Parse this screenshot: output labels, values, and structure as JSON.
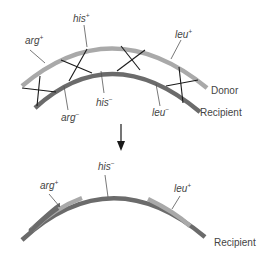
{
  "colors": {
    "donor": "#a9a9a9",
    "recipient": "#6b6b6b",
    "crossover": "#1a1a1a",
    "leader": "#555555",
    "text": "#444444"
  },
  "top": {
    "donor_label": "Donor",
    "recipient_label": "Recipient",
    "genes_donor": [
      {
        "name": "arg",
        "sup": "+"
      },
      {
        "name": "his",
        "sup": "+"
      },
      {
        "name": "leu",
        "sup": "+"
      }
    ],
    "genes_recipient": [
      {
        "name": "arg",
        "sup": "−"
      },
      {
        "name": "his",
        "sup": "−"
      },
      {
        "name": "leu",
        "sup": "−"
      }
    ]
  },
  "bottom": {
    "recipient_label": "Recipient",
    "genes": [
      {
        "name": "arg",
        "sup": "+"
      },
      {
        "name": "his",
        "sup": "−"
      },
      {
        "name": "leu",
        "sup": "+"
      }
    ]
  }
}
